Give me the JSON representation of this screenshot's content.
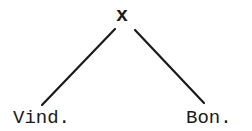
{
  "tree": {
    "root": {
      "label": "x"
    },
    "children": [
      {
        "label": "Vind."
      },
      {
        "label": "Bon."
      }
    ]
  },
  "colors": {
    "line": "#1a1a1a",
    "text": "#1a1a1a",
    "background": "#ffffff"
  }
}
